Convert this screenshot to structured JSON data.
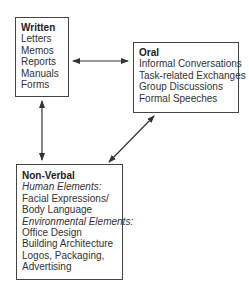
{
  "diagram": {
    "nodes": [
      {
        "id": "written",
        "title": "Written",
        "items": [
          "Letters",
          "Memos",
          "Reports",
          "Manuals",
          "Forms"
        ]
      },
      {
        "id": "oral",
        "title": "Oral",
        "items": [
          "Informal Conversations",
          "Task-related Exchanges",
          "Group Discussions",
          "Formal Speeches"
        ]
      },
      {
        "id": "nonverbal",
        "title": "Non-Verbal",
        "sections": [
          {
            "heading": "Human Elements:",
            "items": [
              "Facial Expressions/",
              "Body Language"
            ]
          },
          {
            "heading": "Environmental Elements:",
            "items": [
              "Office Design",
              "Building Architecture",
              "Logos, Packaging,",
              "Advertising"
            ]
          }
        ]
      }
    ],
    "edges": [
      {
        "from": "written",
        "to": "oral",
        "type": "bidirectional"
      },
      {
        "from": "written",
        "to": "nonverbal",
        "type": "bidirectional"
      },
      {
        "from": "oral",
        "to": "nonverbal",
        "type": "bidirectional"
      }
    ],
    "colors": {
      "stroke": "#444444",
      "text": "#333333",
      "background": "#ffffff"
    }
  }
}
